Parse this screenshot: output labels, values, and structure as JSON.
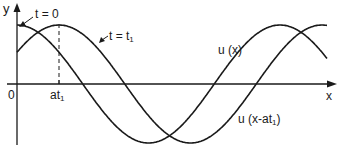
{
  "diagram": {
    "type": "traveling-wave",
    "axes": {
      "y_label": "y",
      "x_label": "x",
      "origin_label": "0",
      "tick_label_main": "at",
      "tick_label_sub": "1"
    },
    "curves": [
      {
        "id": "u-x",
        "time_label": "t = 0",
        "function_label": "u (x)",
        "description": "wave at t = 0, maximum at x = 0"
      },
      {
        "id": "u-x-minus-at1",
        "time_label_main": "t = t",
        "time_label_sub": "1",
        "function_label_main": "u (x-at",
        "function_label_sub": "1",
        "function_label_close": ")",
        "description": "same wave shifted right by at1 at t = t1"
      }
    ],
    "colors": {
      "line": "#1a1a1a",
      "background": "#ffffff"
    }
  }
}
